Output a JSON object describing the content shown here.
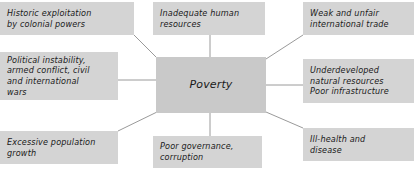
{
  "diagram": {
    "type": "mind-map",
    "center": {
      "id": "poverty",
      "label": "Poverty",
      "lines": [
        "Poverty"
      ],
      "box": {
        "x": 156,
        "y": 57,
        "w": 110,
        "h": 56
      },
      "fill": "#c9c9c9"
    },
    "nodes": [
      {
        "id": "historic-exploitation",
        "lines": [
          "Historic exploitation",
          "by colonial powers"
        ],
        "box": {
          "x": 0,
          "y": 2,
          "w": 134,
          "h": 33
        },
        "fill": "#d4d4d4"
      },
      {
        "id": "inadequate-human-resources",
        "lines": [
          "Inadequate human",
          "resources"
        ],
        "box": {
          "x": 153,
          "y": 2,
          "w": 112,
          "h": 33
        },
        "fill": "#d4d4d4"
      },
      {
        "id": "weak-unfair-trade",
        "lines": [
          "Weak and unfair",
          "international trade"
        ],
        "box": {
          "x": 303,
          "y": 2,
          "w": 111,
          "h": 33
        },
        "fill": "#d4d4d4"
      },
      {
        "id": "political-instability",
        "lines": [
          "Political instability,",
          "armed conflict, civil",
          "and international",
          "wars"
        ],
        "box": {
          "x": 0,
          "y": 52,
          "w": 118,
          "h": 48
        },
        "fill": "#d4d4d4"
      },
      {
        "id": "underdeveloped-resources",
        "lines": [
          "Underdeveloped",
          "natural resources",
          "Poor infrastructure"
        ],
        "box": {
          "x": 303,
          "y": 59,
          "w": 111,
          "h": 44
        },
        "fill": "#d4d4d4"
      },
      {
        "id": "excessive-population-growth",
        "lines": [
          "Excessive population",
          "growth"
        ],
        "box": {
          "x": 0,
          "y": 131,
          "w": 118,
          "h": 33
        },
        "fill": "#d4d4d4"
      },
      {
        "id": "poor-governance",
        "lines": [
          "Poor governance,",
          "corruption"
        ],
        "box": {
          "x": 153,
          "y": 136,
          "w": 109,
          "h": 32
        },
        "fill": "#d4d4d4"
      },
      {
        "id": "ill-health-disease",
        "lines": [
          "Ill-health and",
          "disease"
        ],
        "box": {
          "x": 303,
          "y": 128,
          "w": 111,
          "h": 33
        },
        "fill": "#d4d4d4"
      }
    ],
    "connectors": [
      {
        "from": "historic-exploitation",
        "to": "poverty",
        "x1": 134,
        "y1": 35,
        "x2": 158,
        "y2": 59
      },
      {
        "from": "inadequate-human-resources",
        "to": "poverty",
        "x1": 210,
        "y1": 35,
        "x2": 210,
        "y2": 57
      },
      {
        "from": "weak-unfair-trade",
        "to": "poverty",
        "x1": 303,
        "y1": 35,
        "x2": 266,
        "y2": 59
      },
      {
        "from": "political-instability",
        "to": "poverty",
        "x1": 118,
        "y1": 80,
        "x2": 156,
        "y2": 80
      },
      {
        "from": "underdeveloped-resources",
        "to": "poverty",
        "x1": 303,
        "y1": 85,
        "x2": 266,
        "y2": 85
      },
      {
        "from": "excessive-population-growth",
        "to": "poverty",
        "x1": 118,
        "y1": 131,
        "x2": 157,
        "y2": 112
      },
      {
        "from": "poor-governance",
        "to": "poverty",
        "x1": 210,
        "y1": 136,
        "x2": 210,
        "y2": 113
      },
      {
        "from": "ill-health-disease",
        "to": "poverty",
        "x1": 303,
        "y1": 128,
        "x2": 266,
        "y2": 112
      }
    ],
    "colors": {
      "background": "#ffffff",
      "node_fill": "#d4d4d4",
      "center_fill": "#c9c9c9",
      "text": "#1a1a1a",
      "connector": "#9a9a9a"
    }
  }
}
